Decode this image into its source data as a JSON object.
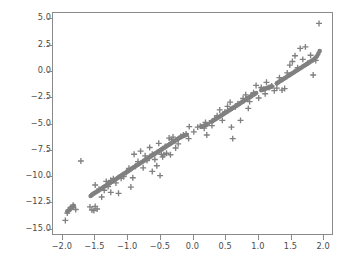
{
  "chart_data": {
    "type": "scatter",
    "title": "",
    "xlabel": "",
    "ylabel": "",
    "xlim": [
      -2.15,
      2.15
    ],
    "ylim": [
      -15.6,
      5.6
    ],
    "grid": false,
    "legend": null,
    "xticks": [
      -2.0,
      -1.5,
      -1.0,
      -0.5,
      0.0,
      0.5,
      1.0,
      1.5,
      2.0
    ],
    "yticks": [
      5.0,
      2.5,
      0.0,
      -2.5,
      -5.0,
      -7.5,
      -10.0,
      -12.5,
      -15.0
    ],
    "xtick_labels": [
      "−2.0",
      "−1.5",
      "−1.0",
      "−0.5",
      "0.0",
      "0.5",
      "1.0",
      "1.5",
      "2.0"
    ],
    "ytick_labels": [
      "5.0",
      "2.5",
      "0.0",
      "−2.5",
      "−5.0",
      "−7.5",
      "−10.0",
      "−12.5",
      "−15.0"
    ],
    "marker_color": "#808080",
    "series": [
      {
        "name": "fitted",
        "marker": "circle",
        "color": "#808080",
        "points": [
          [
            -1.93,
            -13.45
          ],
          [
            -1.92,
            -13.4
          ],
          [
            -1.9,
            -13.3
          ],
          [
            -1.89,
            -13.25
          ],
          [
            -1.88,
            -13.15
          ],
          [
            -1.87,
            -13.1
          ],
          [
            -1.86,
            -13.05
          ],
          [
            -1.85,
            -13.0
          ],
          [
            -1.84,
            -12.95
          ],
          [
            -1.83,
            -12.9
          ],
          [
            -1.57,
            -11.95
          ],
          [
            -1.55,
            -11.85
          ],
          [
            -1.53,
            -11.75
          ],
          [
            -1.51,
            -11.68
          ],
          [
            -1.49,
            -11.6
          ],
          [
            -1.47,
            -11.52
          ],
          [
            -1.45,
            -11.44
          ],
          [
            -1.43,
            -11.36
          ],
          [
            -1.41,
            -11.28
          ],
          [
            -1.39,
            -11.2
          ],
          [
            -1.37,
            -11.1
          ],
          [
            -1.35,
            -11.02
          ],
          [
            -1.33,
            -10.94
          ],
          [
            -1.31,
            -10.86
          ],
          [
            -1.29,
            -10.78
          ],
          [
            -1.27,
            -10.7
          ],
          [
            -1.25,
            -10.62
          ],
          [
            -1.23,
            -10.54
          ],
          [
            -1.21,
            -10.46
          ],
          [
            -1.19,
            -10.38
          ],
          [
            -1.17,
            -10.3
          ],
          [
            -1.15,
            -10.2
          ],
          [
            -1.13,
            -10.12
          ],
          [
            -1.11,
            -10.04
          ],
          [
            -1.09,
            -9.96
          ],
          [
            -1.07,
            -9.88
          ],
          [
            -1.05,
            -9.8
          ],
          [
            -1.03,
            -9.72
          ],
          [
            -1.01,
            -9.64
          ],
          [
            -0.99,
            -9.56
          ],
          [
            -0.97,
            -9.48
          ],
          [
            -0.95,
            -9.4
          ],
          [
            -0.93,
            -9.3
          ],
          [
            -0.91,
            -9.22
          ],
          [
            -0.89,
            -9.14
          ],
          [
            -0.87,
            -9.06
          ],
          [
            -0.85,
            -8.98
          ],
          [
            -0.83,
            -8.9
          ],
          [
            -0.81,
            -8.82
          ],
          [
            -0.79,
            -8.74
          ],
          [
            -0.77,
            -8.66
          ],
          [
            -0.75,
            -8.58
          ],
          [
            -0.73,
            -8.5
          ],
          [
            -0.71,
            -8.42
          ],
          [
            -0.69,
            -8.34
          ],
          [
            -0.67,
            -8.26
          ],
          [
            -0.65,
            -8.18
          ],
          [
            -0.63,
            -8.1
          ],
          [
            -0.61,
            -8.02
          ],
          [
            -0.59,
            -7.94
          ],
          [
            -0.57,
            -7.86
          ],
          [
            -0.55,
            -7.78
          ],
          [
            -0.53,
            -7.7
          ],
          [
            -0.51,
            -7.62
          ],
          [
            -0.49,
            -7.54
          ],
          [
            -0.47,
            -7.46
          ],
          [
            -0.45,
            -7.38
          ],
          [
            -0.43,
            -7.3
          ],
          [
            -0.41,
            -7.22
          ],
          [
            -0.39,
            -7.14
          ],
          [
            -0.37,
            -7.06
          ],
          [
            -0.35,
            -6.98
          ],
          [
            -0.33,
            -6.9
          ],
          [
            -0.31,
            -6.82
          ],
          [
            -0.29,
            -6.74
          ],
          [
            -0.27,
            -6.66
          ],
          [
            -0.25,
            -6.58
          ],
          [
            -0.23,
            -6.5
          ],
          [
            -0.21,
            -6.42
          ],
          [
            -0.19,
            -6.34
          ],
          [
            -0.17,
            -6.28
          ],
          [
            -0.15,
            -6.22
          ],
          [
            -0.13,
            -6.16
          ],
          [
            -0.11,
            -6.12
          ],
          [
            -0.09,
            -6.08
          ],
          [
            0.14,
            -5.3
          ],
          [
            0.16,
            -5.26
          ],
          [
            0.18,
            -5.22
          ],
          [
            0.2,
            -5.18
          ],
          [
            0.22,
            -5.12
          ],
          [
            0.3,
            -4.8
          ],
          [
            0.32,
            -4.72
          ],
          [
            0.34,
            -4.64
          ],
          [
            0.36,
            -4.56
          ],
          [
            0.38,
            -4.48
          ],
          [
            0.4,
            -4.4
          ],
          [
            0.42,
            -4.32
          ],
          [
            0.44,
            -4.24
          ],
          [
            0.46,
            -4.16
          ],
          [
            0.48,
            -4.08
          ],
          [
            0.5,
            -4.0
          ],
          [
            0.52,
            -3.92
          ],
          [
            0.54,
            -3.84
          ],
          [
            0.56,
            -3.76
          ],
          [
            0.58,
            -3.68
          ],
          [
            0.6,
            -3.6
          ],
          [
            0.62,
            -3.52
          ],
          [
            0.64,
            -3.44
          ],
          [
            0.66,
            -3.36
          ],
          [
            0.68,
            -3.28
          ],
          [
            0.7,
            -3.2
          ],
          [
            0.72,
            -3.12
          ],
          [
            0.74,
            -3.04
          ],
          [
            0.76,
            -2.96
          ],
          [
            0.78,
            -2.88
          ],
          [
            0.8,
            -2.8
          ],
          [
            0.82,
            -2.72
          ],
          [
            0.84,
            -2.64
          ],
          [
            0.86,
            -2.56
          ],
          [
            0.88,
            -2.48
          ],
          [
            0.9,
            -2.4
          ],
          [
            0.92,
            -2.32
          ],
          [
            0.94,
            -2.24
          ],
          [
            0.96,
            -2.16
          ],
          [
            0.98,
            -2.08
          ],
          [
            1.06,
            -1.8
          ],
          [
            1.08,
            -1.74
          ],
          [
            1.1,
            -1.7
          ],
          [
            1.12,
            -1.66
          ],
          [
            1.14,
            -1.62
          ],
          [
            1.16,
            -1.58
          ],
          [
            1.18,
            -1.54
          ],
          [
            1.2,
            -1.5
          ],
          [
            1.22,
            -1.46
          ],
          [
            1.3,
            -1.15
          ],
          [
            1.32,
            -1.06
          ],
          [
            1.34,
            -0.98
          ],
          [
            1.36,
            -0.9
          ],
          [
            1.38,
            -0.82
          ],
          [
            1.4,
            -0.74
          ],
          [
            1.42,
            -0.66
          ],
          [
            1.44,
            -0.58
          ],
          [
            1.46,
            -0.5
          ],
          [
            1.48,
            -0.42
          ],
          [
            1.5,
            -0.34
          ],
          [
            1.52,
            -0.26
          ],
          [
            1.54,
            -0.18
          ],
          [
            1.56,
            -0.1
          ],
          [
            1.58,
            -0.02
          ],
          [
            1.6,
            0.06
          ],
          [
            1.62,
            0.14
          ],
          [
            1.64,
            0.22
          ],
          [
            1.66,
            0.3
          ],
          [
            1.68,
            0.38
          ],
          [
            1.7,
            0.46
          ],
          [
            1.72,
            0.54
          ],
          [
            1.74,
            0.62
          ],
          [
            1.76,
            0.7
          ],
          [
            1.78,
            0.78
          ],
          [
            1.8,
            0.86
          ],
          [
            1.82,
            0.94
          ],
          [
            1.84,
            1.02
          ],
          [
            1.86,
            1.1
          ],
          [
            1.88,
            1.2
          ],
          [
            1.9,
            1.32
          ],
          [
            1.92,
            1.48
          ],
          [
            1.94,
            1.7
          ],
          [
            1.96,
            1.95
          ],
          [
            0.85,
            -2.55
          ],
          [
            1.22,
            -1.45
          ]
        ]
      },
      {
        "name": "observed",
        "marker": "plus",
        "color": "#808080",
        "points": [
          [
            -1.96,
            -14.3
          ],
          [
            -1.93,
            -13.6
          ],
          [
            -1.88,
            -13.05
          ],
          [
            -1.84,
            -12.85
          ],
          [
            -1.8,
            -13.25
          ],
          [
            -1.72,
            -8.6
          ],
          [
            -1.58,
            -13.0
          ],
          [
            -1.55,
            -13.3
          ],
          [
            -1.52,
            -13.35
          ],
          [
            -1.5,
            -12.95
          ],
          [
            -1.47,
            -13.2
          ],
          [
            -1.44,
            -11.3
          ],
          [
            -1.4,
            -12.05
          ],
          [
            -1.36,
            -11.4
          ],
          [
            -1.33,
            -10.55
          ],
          [
            -1.3,
            -11.05
          ],
          [
            -1.26,
            -10.45
          ],
          [
            -1.22,
            -10.3
          ],
          [
            -1.18,
            -10.7
          ],
          [
            -1.14,
            -11.7
          ],
          [
            -1.1,
            -10.25
          ],
          [
            -1.06,
            -10.1
          ],
          [
            -1.02,
            -9.7
          ],
          [
            -0.98,
            -9.3
          ],
          [
            -0.95,
            -11.1
          ],
          [
            -0.92,
            -10.2
          ],
          [
            -0.88,
            -9.1
          ],
          [
            -0.84,
            -8.65
          ],
          [
            -0.8,
            -7.65
          ],
          [
            -0.76,
            -9.25
          ],
          [
            -0.73,
            -8.1
          ],
          [
            -0.7,
            -8.55
          ],
          [
            -0.66,
            -7.3
          ],
          [
            -0.62,
            -7.95
          ],
          [
            -0.58,
            -8.45
          ],
          [
            -0.55,
            -9.05
          ],
          [
            -0.52,
            -6.9
          ],
          [
            -0.5,
            -10.0
          ],
          [
            -0.48,
            -7.95
          ],
          [
            -0.46,
            -8.2
          ],
          [
            -0.44,
            -8.0
          ],
          [
            -0.42,
            -7.2
          ],
          [
            -0.4,
            -7.85
          ],
          [
            -0.36,
            -6.4
          ],
          [
            -0.34,
            -8.0
          ],
          [
            -0.32,
            -6.55
          ],
          [
            -0.3,
            -6.3
          ],
          [
            -0.26,
            -7.35
          ],
          [
            -0.22,
            -6.95
          ],
          [
            -0.18,
            -6.25
          ],
          [
            -0.14,
            -6.1
          ],
          [
            -0.1,
            -6.0
          ],
          [
            -0.06,
            -6.45
          ],
          [
            0.02,
            -5.8
          ],
          [
            0.08,
            -5.35
          ],
          [
            0.12,
            -5.25
          ],
          [
            0.18,
            -5.45
          ],
          [
            0.22,
            -6.1
          ],
          [
            0.26,
            -4.95
          ],
          [
            0.3,
            -5.2
          ],
          [
            0.34,
            -4.55
          ],
          [
            0.38,
            -4.25
          ],
          [
            0.42,
            -3.7
          ],
          [
            0.46,
            -4.7
          ],
          [
            0.5,
            -3.9
          ],
          [
            0.54,
            -3.35
          ],
          [
            0.58,
            -2.95
          ],
          [
            0.62,
            -6.45
          ],
          [
            0.66,
            -3.4
          ],
          [
            0.7,
            -3.1
          ],
          [
            0.74,
            -4.7
          ],
          [
            0.78,
            -2.6
          ],
          [
            0.82,
            -2.25
          ],
          [
            0.86,
            -3.55
          ],
          [
            0.9,
            -2.35
          ],
          [
            0.94,
            -2.05
          ],
          [
            0.98,
            -1.35
          ],
          [
            1.02,
            -2.55
          ],
          [
            1.06,
            -1.55
          ],
          [
            1.1,
            -1.7
          ],
          [
            1.14,
            -1.05
          ],
          [
            1.18,
            -1.55
          ],
          [
            1.22,
            -1.4
          ],
          [
            1.26,
            -1.85
          ],
          [
            1.3,
            -1.6
          ],
          [
            1.34,
            -0.6
          ],
          [
            1.38,
            -1.8
          ],
          [
            1.42,
            -1.65
          ],
          [
            1.46,
            -0.15
          ],
          [
            1.5,
            0.6
          ],
          [
            1.54,
            0.95
          ],
          [
            1.58,
            1.5
          ],
          [
            1.62,
            0.35
          ],
          [
            1.66,
            2.2
          ],
          [
            1.7,
            1.15
          ],
          [
            1.74,
            2.35
          ],
          [
            1.78,
            0.8
          ],
          [
            1.82,
            1.55
          ],
          [
            1.86,
            -0.35
          ],
          [
            1.9,
            1.05
          ],
          [
            1.95,
            4.6
          ],
          [
            0.6,
            -5.35
          ],
          [
            -0.62,
            -9.6
          ],
          [
            -1.5,
            -10.9
          ],
          [
            0.88,
            -2.9
          ],
          [
            1.12,
            -2.15
          ],
          [
            -0.05,
            -5.3
          ],
          [
            0.2,
            -4.9
          ],
          [
            -0.9,
            -7.95
          ],
          [
            -1.26,
            -11.6
          ]
        ]
      }
    ]
  }
}
